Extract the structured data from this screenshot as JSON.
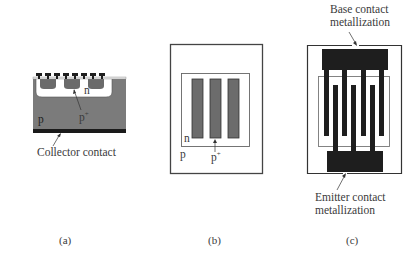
{
  "figure": {
    "panels": [
      {
        "id": "a",
        "caption": "(a)",
        "view": "cross-section",
        "labels": {
          "n_region": "n",
          "p_plus": "p",
          "p_plus_sup": "+",
          "p_substrate": "p",
          "collector": "Collector contact"
        }
      },
      {
        "id": "b",
        "caption": "(b)",
        "view": "top-view diffusion layout",
        "labels": {
          "n_region": "n",
          "p_substrate": "p",
          "p_plus": "p",
          "p_plus_sup": "+"
        },
        "stripe_count": 3
      },
      {
        "id": "c",
        "caption": "(c)",
        "view": "top-view interdigitated metallization",
        "labels": {
          "base_line1": "Base contact",
          "base_line2": "metallization",
          "emitter_line1": "Emitter contact",
          "emitter_line2": "metallization"
        },
        "base_finger_count": 4,
        "emitter_finger_count": 3
      }
    ],
    "colors": {
      "substrate": "#7a7a7a",
      "metal": "#1e1e1e",
      "p_plus_fill": "#6c6c6c",
      "outline": "#444444"
    }
  }
}
